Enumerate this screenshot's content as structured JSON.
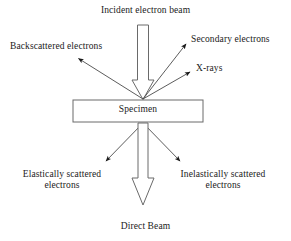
{
  "diagram": {
    "background_color": "#ffffff",
    "line_color": "#555555",
    "text_color": "#1a1a1a",
    "labels": {
      "incident_beam": "Incident electron beam",
      "backscattered": "Backscattered electrons",
      "secondary": "Secondary electrons",
      "xrays": "X-rays",
      "specimen": "Specimen",
      "elastically_scattered": "Elastically scattered electrons",
      "inelastically_scattered": "Inelastically scattered electrons",
      "direct_beam": "Direct Beam"
    },
    "specimen_box": {
      "label": "Specimen",
      "x": 73,
      "y": 100,
      "width": 130,
      "height": 22
    },
    "arrows": [
      {
        "name": "incident-electron-beam-arrow",
        "style": "hollow-block",
        "direction": "down",
        "from": [
          143,
          25
        ],
        "to": [
          143,
          99
        ]
      },
      {
        "name": "backscattered-electrons-arrow",
        "style": "solid-line",
        "direction": "up-left",
        "from": [
          143,
          99
        ],
        "to": [
          76,
          57
        ]
      },
      {
        "name": "secondary-electrons-arrow",
        "style": "solid-line",
        "direction": "up-right",
        "from": [
          143,
          99
        ],
        "to": [
          188,
          42
        ]
      },
      {
        "name": "xrays-arrow",
        "style": "solid-line",
        "direction": "up-right",
        "from": [
          143,
          99
        ],
        "to": [
          192,
          71
        ]
      },
      {
        "name": "elastically-scattered-electrons-arrow",
        "style": "solid-line",
        "direction": "down-left",
        "from": [
          143,
          123
        ],
        "to": [
          104,
          163
        ]
      },
      {
        "name": "inelastically-scattered-electrons-arrow",
        "style": "solid-line",
        "direction": "down-right",
        "from": [
          143,
          123
        ],
        "to": [
          182,
          163
        ]
      },
      {
        "name": "direct-beam-arrow",
        "style": "hollow-block",
        "direction": "down",
        "from": [
          143,
          123
        ],
        "to": [
          143,
          205
        ]
      }
    ]
  }
}
